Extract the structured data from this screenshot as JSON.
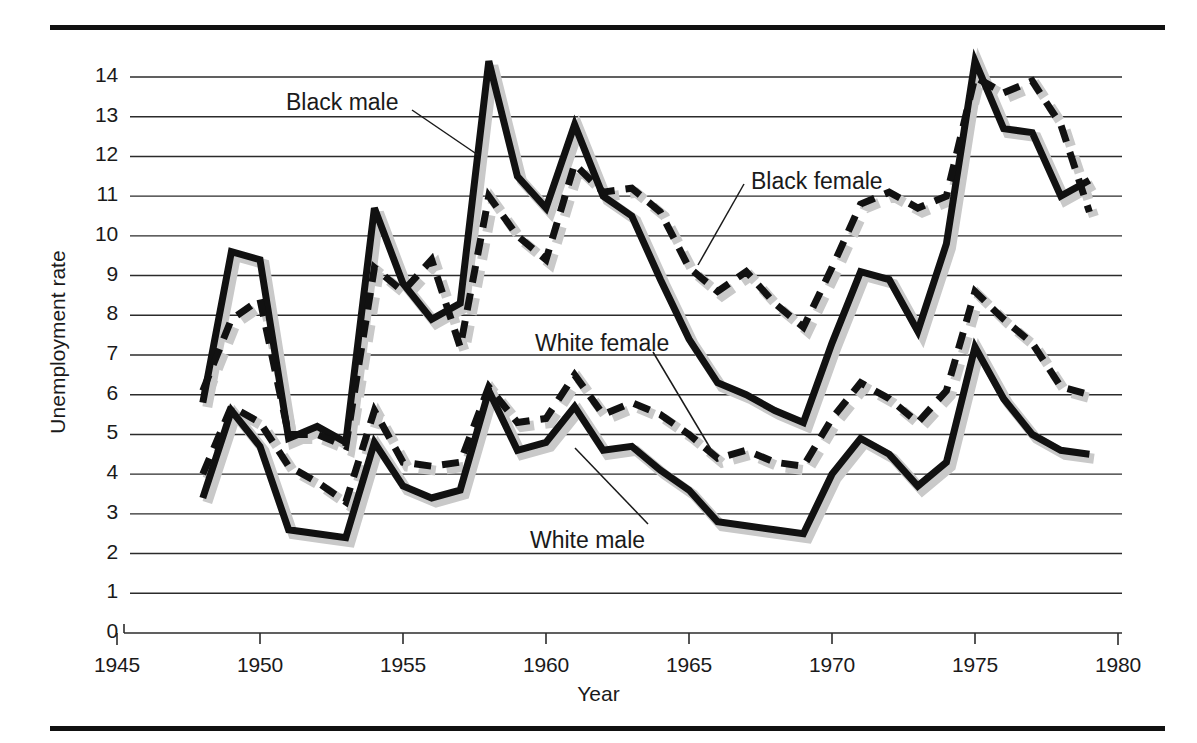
{
  "chart_data": {
    "type": "line",
    "title": "",
    "xlabel": "Year",
    "ylabel": "Unemployment rate",
    "xlim": [
      1945,
      1980
    ],
    "ylim": [
      0,
      14.6
    ],
    "xticks": [
      "1945",
      "1950",
      "1955",
      "1960",
      "1965",
      "1970",
      "1975",
      "1980"
    ],
    "xtick_values": [
      1945,
      1950,
      1955,
      1960,
      1965,
      1970,
      1975,
      1980
    ],
    "yticks": [
      "0",
      "1",
      "2",
      "3",
      "4",
      "5",
      "6",
      "7",
      "8",
      "9",
      "10",
      "11",
      "12",
      "13",
      "14"
    ],
    "ytick_values": [
      0,
      1,
      2,
      3,
      4,
      5,
      6,
      7,
      8,
      9,
      10,
      11,
      12,
      13,
      14
    ],
    "grid": "horizontal",
    "legend_position": "inline-annotations",
    "x": [
      1948,
      1949,
      1950,
      1951,
      1952,
      1953,
      1954,
      1955,
      1956,
      1957,
      1958,
      1959,
      1960,
      1961,
      1962,
      1963,
      1964,
      1965,
      1966,
      1967,
      1968,
      1969,
      1970,
      1971,
      1972,
      1973,
      1974,
      1975,
      1976,
      1977,
      1978,
      1979
    ],
    "series": [
      {
        "name": "Black male",
        "style": "solid",
        "color": "#111111",
        "values": [
          5.8,
          9.6,
          9.4,
          4.9,
          5.2,
          4.8,
          10.7,
          8.8,
          7.9,
          8.3,
          14.4,
          11.5,
          10.7,
          12.8,
          11.0,
          10.5,
          8.9,
          7.4,
          6.3,
          6.0,
          5.6,
          5.3,
          7.3,
          9.1,
          8.9,
          7.6,
          9.8,
          14.4,
          12.7,
          12.6,
          11.0,
          11.4
        ]
      },
      {
        "name": "Black female",
        "style": "dashed",
        "color": "#111111",
        "values": [
          6.1,
          7.9,
          8.4,
          5.0,
          5.0,
          4.7,
          9.2,
          8.6,
          9.4,
          7.2,
          11.0,
          10.0,
          9.4,
          11.8,
          11.1,
          11.2,
          10.6,
          9.2,
          8.6,
          9.1,
          8.3,
          7.7,
          9.2,
          10.8,
          11.1,
          10.7,
          11.0,
          14.0,
          13.6,
          13.9,
          12.8,
          10.6
        ]
      },
      {
        "name": "White female",
        "style": "dashed",
        "color": "#111111",
        "values": [
          4.0,
          5.7,
          5.3,
          4.2,
          3.8,
          3.3,
          5.6,
          4.3,
          4.2,
          4.3,
          6.2,
          5.3,
          5.4,
          6.5,
          5.5,
          5.8,
          5.5,
          5.0,
          4.4,
          4.6,
          4.3,
          4.2,
          5.4,
          6.3,
          5.9,
          5.3,
          6.1,
          8.6,
          7.9,
          7.3,
          6.2,
          6.0
        ]
      },
      {
        "name": "White male",
        "style": "solid",
        "color": "#111111",
        "values": [
          3.4,
          5.6,
          4.7,
          2.6,
          2.5,
          2.4,
          4.8,
          3.7,
          3.4,
          3.6,
          6.1,
          4.6,
          4.8,
          5.7,
          4.6,
          4.7,
          4.1,
          3.6,
          2.8,
          2.7,
          2.6,
          2.5,
          4.0,
          4.9,
          4.5,
          3.7,
          4.3,
          7.2,
          5.9,
          5.0,
          4.6,
          4.5
        ]
      }
    ],
    "annotations": [
      {
        "text": "Black male",
        "x": 286,
        "y": 89,
        "leader": [
          [
            412,
            110
          ],
          [
            478,
            155
          ]
        ]
      },
      {
        "text": "Black female",
        "x": 751,
        "y": 168,
        "leader": [
          [
            744,
            184
          ],
          [
            698,
            265
          ]
        ]
      },
      {
        "text": "White female",
        "x": 535,
        "y": 330,
        "leader": [
          [
            653,
            352
          ],
          [
            712,
            451
          ]
        ]
      },
      {
        "text": "White male",
        "x": 530,
        "y": 527,
        "leader": [
          [
            648,
            524
          ],
          [
            575,
            448
          ]
        ]
      }
    ]
  }
}
